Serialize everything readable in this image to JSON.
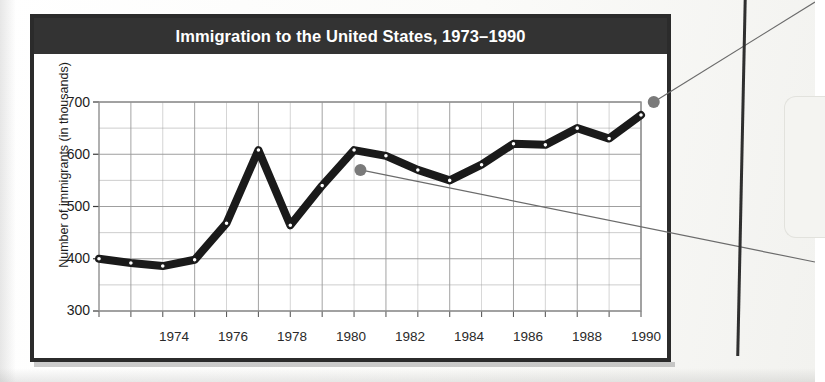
{
  "figure": {
    "title": "Immigration to the United States, 1973–1990"
  },
  "axes": {
    "y_title": "Number of immigrants (in thousands)",
    "y_ticks": [
      "700",
      "600",
      "500",
      "400",
      "300"
    ],
    "x_ticks": [
      "1974",
      "1976",
      "1978",
      "1980",
      "1982",
      "1984",
      "1986",
      "1988",
      "1990"
    ]
  },
  "colors": {
    "title_bar": "#333333",
    "title_text": "#ffffff",
    "frame": "#2b2b2b",
    "series_line": "#1a1a1a",
    "marker_fill": "#ffffff",
    "grid": "#9a9a9a",
    "callout_dot": "#7a7a7a",
    "callout_line": "#6b6b6b"
  },
  "chart_data": {
    "type": "line",
    "title": "Immigration to the United States, 1973–1990",
    "xlabel": "",
    "ylabel": "Number of immigrants (in thousands)",
    "xlim": [
      1973,
      1990
    ],
    "ylim": [
      300,
      700
    ],
    "xticks": [
      1974,
      1976,
      1978,
      1980,
      1982,
      1984,
      1986,
      1988,
      1990
    ],
    "yticks": [
      300,
      400,
      500,
      600,
      700
    ],
    "grid": true,
    "grid_minor_y_step": 50,
    "legend": null,
    "x": [
      1973,
      1974,
      1975,
      1976,
      1977,
      1978,
      1979,
      1980,
      1981,
      1982,
      1983,
      1984,
      1985,
      1986,
      1987,
      1988,
      1989,
      1990
    ],
    "values": [
      400,
      392,
      386,
      398,
      468,
      608,
      464,
      540,
      608,
      597,
      570,
      550,
      580,
      620,
      618,
      650,
      630,
      675
    ],
    "markers": "open-circle",
    "annotations": [
      {
        "name": "callout-dot-upper",
        "x": 1990.4,
        "y": 700,
        "note": "leader line to right margin"
      },
      {
        "name": "callout-dot-lower",
        "x": 1981.2,
        "y": 570,
        "note": "leader line to right margin"
      }
    ]
  }
}
